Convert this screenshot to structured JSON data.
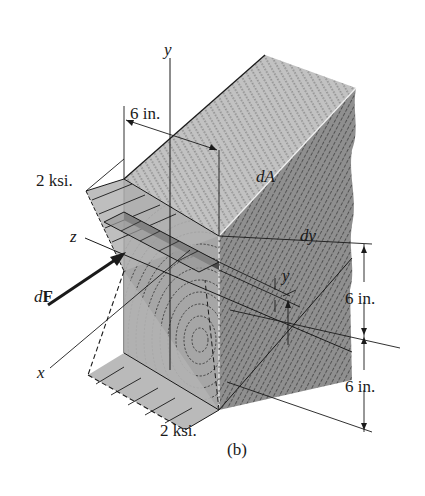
{
  "figure": {
    "caption": "(b)",
    "colors": {
      "wood_top": "#bdbdbd",
      "wood_side": "#8e8e8e",
      "wood_front": "#a8a8a8",
      "stress_block": "#b5b5b5",
      "element_strip": "#555555",
      "line": "#1a1a1a",
      "background": "#ffffff"
    }
  },
  "axes": {
    "x_label": "x",
    "y_label": "y",
    "z_label": "z"
  },
  "labels": {
    "width_dim": "6 in.",
    "upper_height_dim": "6 in.",
    "lower_height_dim": "6 in.",
    "top_stress": "2 ksi.",
    "bottom_stress": "2 ksi.",
    "area_element": "dA",
    "thickness": "dy",
    "height_var": "y",
    "force_prefix": "d",
    "force_symbol": "F"
  }
}
